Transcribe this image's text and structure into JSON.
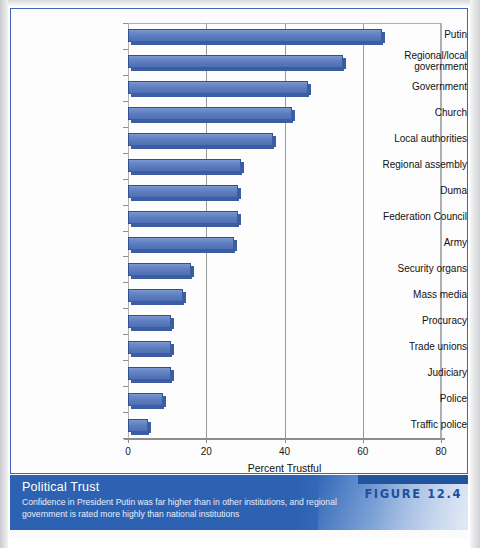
{
  "chart_data": {
    "type": "bar",
    "orientation": "horizontal",
    "title": "Political Trust",
    "xlabel": "Percent Trustful",
    "ylabel": "",
    "xlim": [
      0,
      80
    ],
    "xticks": [
      0,
      20,
      40,
      60,
      80
    ],
    "grid": true,
    "legend": false,
    "categories": [
      "Putin",
      "Regional/local\ngovernment",
      "Government",
      "Church",
      "Local authorities",
      "Regional assembly",
      "Duma",
      "Federation Council",
      "Army",
      "Security organs",
      "Mass media",
      "Procuracy",
      "Trade unions",
      "Judiciary",
      "Police",
      "Traffic police"
    ],
    "values": [
      65,
      55,
      46,
      42,
      37,
      29,
      28,
      28,
      27,
      16,
      14,
      11,
      11,
      11,
      9,
      5
    ],
    "bar_color": "#5c7cbf",
    "bar_edge_color": "#2f4f96"
  },
  "caption": {
    "title": "Political Trust",
    "subtitle": "Confidence in President Putin was far higher than in other institutions, and regional government is rated more highly than national institutions",
    "figure_label": "FIGURE 12.4"
  },
  "source": {
    "text": ""
  }
}
